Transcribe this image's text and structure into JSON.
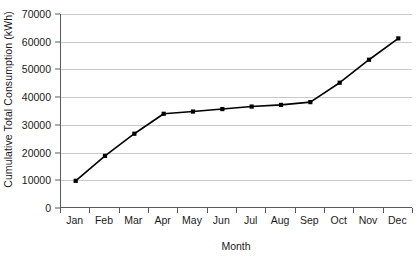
{
  "chart_data": {
    "type": "line",
    "title": "",
    "xlabel": "Month",
    "ylabel": "Cumulative Total Consumption (kWh)",
    "categories": [
      "Jan",
      "Feb",
      "Mar",
      "Apr",
      "May",
      "Jun",
      "Jul",
      "Aug",
      "Sep",
      "Oct",
      "Nov",
      "Dec"
    ],
    "values": [
      9800,
      18800,
      26800,
      34000,
      34800,
      35700,
      36600,
      37200,
      38200,
      45200,
      53500,
      61200
    ],
    "series": [
      {
        "name": "Cumulative Total Consumption",
        "values": [
          9800,
          18800,
          26800,
          34000,
          34800,
          35700,
          36600,
          37200,
          38200,
          45200,
          53500,
          61200
        ]
      }
    ],
    "ylim": [
      0,
      70000
    ],
    "ytick_values": [
      0,
      10000,
      20000,
      30000,
      40000,
      50000,
      60000,
      70000
    ],
    "ytick_labels": [
      "0",
      "10000",
      "20000",
      "30000",
      "40000",
      "50000",
      "60000",
      "70000"
    ],
    "grid": true,
    "grid_axis": "y",
    "legend": false,
    "legend_position": "none",
    "line_color": "#000000",
    "grid_color": "#c9c9c9",
    "axis_color": "#5a5a5a",
    "marker": "square",
    "background_color": "#ffffff"
  }
}
